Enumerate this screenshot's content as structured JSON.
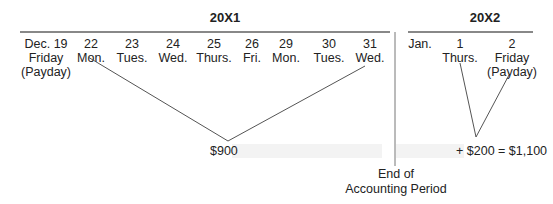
{
  "diagram": {
    "year1": {
      "label": "20X1",
      "days": [
        {
          "date": "Dec. 19",
          "weekday": "Friday",
          "note": "(Payday)"
        },
        {
          "date": "22",
          "weekday": "Mon."
        },
        {
          "date": "23",
          "weekday": "Tues."
        },
        {
          "date": "24",
          "weekday": "Wed."
        },
        {
          "date": "25",
          "weekday": "Thurs."
        },
        {
          "date": "26",
          "weekday": "Fri."
        },
        {
          "date": "29",
          "weekday": "Mon."
        },
        {
          "date": "30",
          "weekday": "Tues."
        },
        {
          "date": "31",
          "weekday": "Wed."
        }
      ],
      "accrued_amount": "$900"
    },
    "year2": {
      "label": "20X2",
      "days": [
        {
          "date": "Jan.",
          "weekday": ""
        },
        {
          "date": "1",
          "weekday": "Thurs."
        },
        {
          "date": "2",
          "weekday": "Friday",
          "note": "(Payday)"
        }
      ],
      "amount_equation": "+ $200 = $1,100"
    },
    "divider_label_line1": "End of",
    "divider_label_line2": "Accounting Period"
  }
}
